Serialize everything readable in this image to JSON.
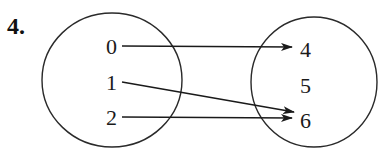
{
  "problem_number": "4.",
  "diagram": {
    "type": "mapping-diagram",
    "domain": {
      "values": [
        "0",
        "1",
        "2"
      ]
    },
    "range": {
      "values": [
        "4",
        "5",
        "6"
      ]
    },
    "mappings": [
      {
        "from": "0",
        "to": "4"
      },
      {
        "from": "1",
        "to": "6"
      },
      {
        "from": "2",
        "to": "6"
      }
    ]
  }
}
